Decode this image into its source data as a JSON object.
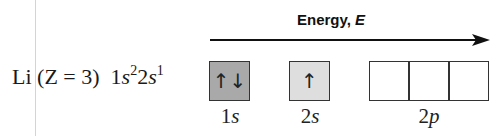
{
  "axis": {
    "label_text": "Energy, ",
    "label_var": "E"
  },
  "element": {
    "symbol": "Li",
    "atomic_number_text": "(Z = 3)",
    "configuration": [
      {
        "n": "1",
        "l": "s",
        "electrons": "2"
      },
      {
        "n": "2",
        "l": "s",
        "electrons": "1"
      }
    ]
  },
  "orbitals": [
    {
      "label_n": "1",
      "label_l": "s",
      "boxes": [
        "↑↓"
      ],
      "fill": "#a9a9a9"
    },
    {
      "label_n": "2",
      "label_l": "s",
      "boxes": [
        "↑"
      ],
      "fill": "#dedede"
    },
    {
      "label_n": "2",
      "label_l": "p",
      "boxes": [
        "",
        "",
        ""
      ],
      "fill": "#ffffff"
    }
  ]
}
